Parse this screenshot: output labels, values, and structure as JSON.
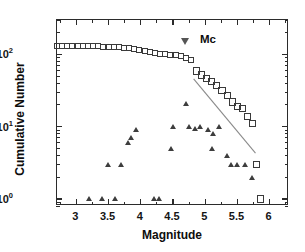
{
  "chart_data": {
    "type": "scatter",
    "title": "",
    "xlabel": "Magnitude",
    "ylabel": "Cumulative Number",
    "xlim": [
      2.7,
      6.3
    ],
    "ylim": [
      0.8,
      300
    ],
    "yscale": "log",
    "xscale": "linear",
    "grid": false,
    "legend": "none",
    "xticks": [
      "3",
      "3.5",
      "4",
      "4.5",
      "5",
      "5.5",
      "6"
    ],
    "xtick_values": [
      3,
      3.5,
      4,
      4.5,
      5,
      5.5,
      6
    ],
    "ytick_labels": [
      "10",
      "10",
      "10"
    ],
    "ytick_exponents": [
      "0",
      "1",
      "2"
    ],
    "ytick_values": [
      1,
      10,
      100
    ],
    "annotations": [
      {
        "name": "mc-marker",
        "label": "Mc",
        "marker": "open-down-triangle",
        "x": 4.7,
        "y": 150
      }
    ],
    "fit_line": {
      "name": "gutenberg-richter-fit",
      "x": [
        4.82,
        5.78
      ],
      "y": [
        46,
        4.3
      ],
      "color": "#8a8a8a"
    },
    "series": [
      {
        "name": "Cumulative Number",
        "marker": "open-square",
        "color": "#3a3a3a",
        "points": [
          [
            2.7,
            133
          ],
          [
            2.78,
            133
          ],
          [
            2.86,
            133
          ],
          [
            2.94,
            132
          ],
          [
            3.02,
            132
          ],
          [
            3.1,
            131
          ],
          [
            3.18,
            131
          ],
          [
            3.26,
            130
          ],
          [
            3.34,
            129
          ],
          [
            3.42,
            128
          ],
          [
            3.5,
            127
          ],
          [
            3.58,
            126
          ],
          [
            3.66,
            125
          ],
          [
            3.74,
            124
          ],
          [
            3.82,
            122
          ],
          [
            3.9,
            120
          ],
          [
            3.98,
            116
          ],
          [
            4.06,
            112
          ],
          [
            4.14,
            108
          ],
          [
            4.22,
            104
          ],
          [
            4.3,
            101
          ],
          [
            4.38,
            100
          ],
          [
            4.46,
            99
          ],
          [
            4.54,
            97
          ],
          [
            4.62,
            95
          ],
          [
            4.7,
            88
          ],
          [
            4.78,
            84
          ],
          [
            4.86,
            59
          ],
          [
            4.94,
            52
          ],
          [
            5.02,
            47
          ],
          [
            5.1,
            42
          ],
          [
            5.18,
            37
          ],
          [
            5.26,
            32
          ],
          [
            5.34,
            27
          ],
          [
            5.42,
            22
          ],
          [
            5.5,
            19
          ],
          [
            5.58,
            18
          ],
          [
            5.66,
            14
          ],
          [
            5.74,
            11
          ],
          [
            5.8,
            3
          ],
          [
            5.86,
            1
          ]
        ]
      },
      {
        "name": "Incremental Number",
        "marker": "filled-triangle",
        "color": "#3d3d3d",
        "points": [
          [
            3.2,
            1
          ],
          [
            3.4,
            1
          ],
          [
            3.6,
            1
          ],
          [
            3.5,
            3
          ],
          [
            3.7,
            3
          ],
          [
            3.8,
            6
          ],
          [
            3.85,
            7
          ],
          [
            3.92,
            9
          ],
          [
            4.2,
            1
          ],
          [
            4.28,
            1
          ],
          [
            4.47,
            5
          ],
          [
            4.5,
            10
          ],
          [
            4.7,
            21
          ],
          [
            4.75,
            10
          ],
          [
            4.85,
            9.5
          ],
          [
            4.92,
            10
          ],
          [
            5.05,
            9
          ],
          [
            5.12,
            8
          ],
          [
            5.1,
            5
          ],
          [
            5.22,
            10
          ],
          [
            5.34,
            4
          ],
          [
            5.4,
            3
          ],
          [
            5.5,
            3
          ],
          [
            5.62,
            3
          ],
          [
            5.72,
            2
          ]
        ]
      }
    ]
  }
}
